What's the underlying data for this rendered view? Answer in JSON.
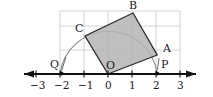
{
  "figure": {
    "type": "geometry-diagram",
    "colors": {
      "square_fill": "#b4b4b4",
      "square_stroke": "#2b2b2b",
      "grid": "#c9c9c9",
      "axis": "#111111",
      "arc": "#8c8c8c",
      "text": "#1a1a1a"
    },
    "grid": {
      "unit_px": 24,
      "origin_px": {
        "x": 108,
        "y": 74
      },
      "x_range": [
        -2,
        3
      ],
      "y_range": [
        0,
        2.6
      ],
      "visible": true
    },
    "axis": {
      "name": "number-line",
      "ticks": [
        {
          "label": "−3",
          "value": -3
        },
        {
          "label": "−2",
          "value": -2
        },
        {
          "label": "−1",
          "value": -1
        },
        {
          "label": "0",
          "value": 0
        },
        {
          "label": "1",
          "value": 1
        },
        {
          "label": "2",
          "value": 2
        },
        {
          "label": "3",
          "value": 3
        }
      ],
      "arrow_left": true,
      "arrow_right": true
    },
    "points": [
      {
        "id": "A",
        "label": "A",
        "x": 2.05,
        "y": 0.8
      },
      {
        "id": "B",
        "label": "B",
        "x": 1.05,
        "y": 2.55
      },
      {
        "id": "C",
        "label": "C",
        "label_x": -0.98,
        "x": -0.95,
        "y": 1.6
      },
      {
        "id": "O",
        "label": "O",
        "x": 0,
        "y": 0
      },
      {
        "id": "P",
        "label": "P",
        "x": 2.05,
        "y": 0
      },
      {
        "id": "Q",
        "label": "Q",
        "x": -2,
        "y": 0
      }
    ],
    "square": {
      "name": "tilted-square-OABC",
      "vertices": [
        "O",
        "A",
        "B",
        "C"
      ],
      "filled": true
    },
    "arc": {
      "name": "quarter-arc-QP",
      "from": "Q",
      "to": "P",
      "radius": 2.05,
      "center": "O"
    },
    "markers": [
      {
        "id": "Q",
        "name": "point-marker-Q"
      },
      {
        "id": "P",
        "name": "point-marker-P"
      }
    ]
  }
}
